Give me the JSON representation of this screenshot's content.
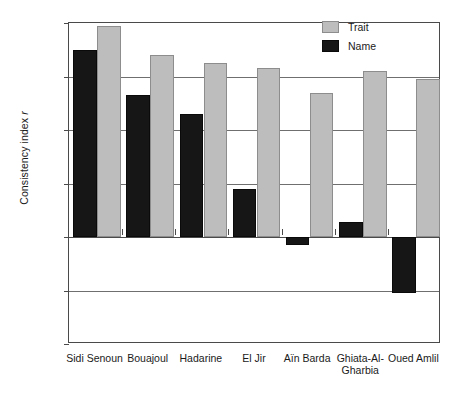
{
  "chart_data": {
    "type": "bar",
    "title": "",
    "xlabel": "",
    "ylabel": "Consistency index r",
    "ylabel_plain": "Consistency index",
    "ylabel_italic": "r",
    "ylim": [
      -0.4,
      0.8
    ],
    "yticks": [
      "0.8",
      "0.6",
      "0.4",
      "0.2",
      "-0.0",
      "-0.2",
      "-0.4"
    ],
    "ytick_values": [
      0.8,
      0.6,
      0.4,
      0.2,
      0.0,
      -0.2,
      -0.4
    ],
    "grid": "horizontal",
    "legend_position": "top-right",
    "categories": [
      "Sidi Senoun",
      "Bouajoul",
      "Hadarine",
      "El Jir",
      "Aïn Barda",
      "Ghiata-Al-\nGharbia",
      "Oued Amlil"
    ],
    "series": [
      {
        "name": "Name",
        "color": "#161616",
        "values": [
          0.7,
          0.53,
          0.46,
          0.18,
          -0.03,
          0.055,
          -0.21
        ]
      },
      {
        "name": "Trait",
        "color": "#bdbdbd",
        "values": [
          0.79,
          0.68,
          0.65,
          0.63,
          0.54,
          0.62,
          0.59
        ]
      }
    ]
  },
  "legend": {
    "items": [
      {
        "label": "Trait",
        "swatch": "trait"
      },
      {
        "label": "Name",
        "swatch": "name"
      }
    ]
  },
  "colors": {
    "trait": "#bdbdbd",
    "name": "#161616",
    "axis": "#4a4a4a",
    "grid": "#6f6f6f",
    "background": "#ffffff"
  }
}
